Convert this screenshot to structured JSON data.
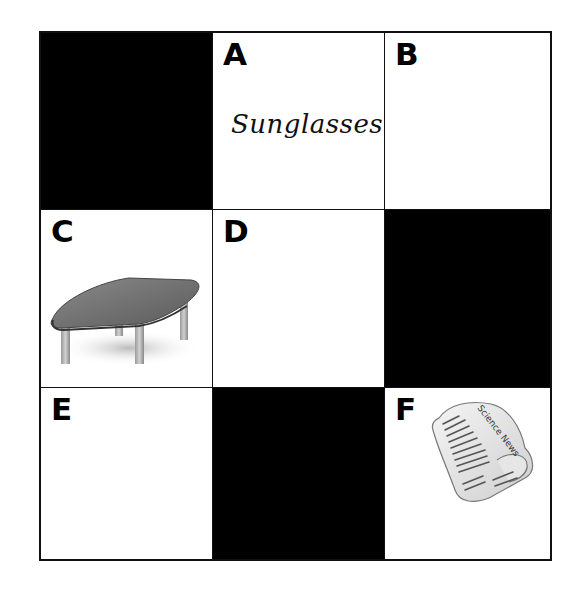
{
  "grid": {
    "rows": 3,
    "cols": 3,
    "cells": [
      {
        "position": "r1c1",
        "label": "",
        "fill": "#000000"
      },
      {
        "position": "r1c2",
        "label": "A",
        "content": "Sunglasses",
        "content_type": "handwritten-text"
      },
      {
        "position": "r1c3",
        "label": "B",
        "content": ""
      },
      {
        "position": "r2c1",
        "label": "C",
        "content": "table-icon",
        "content_type": "image"
      },
      {
        "position": "r2c2",
        "label": "D",
        "content": ""
      },
      {
        "position": "r2c3",
        "label": "",
        "fill": "#000000"
      },
      {
        "position": "r3c1",
        "label": "E",
        "content": ""
      },
      {
        "position": "r3c2",
        "label": "",
        "fill": "#000000"
      },
      {
        "position": "r3c3",
        "label": "F",
        "content": "newspaper-icon",
        "content_type": "image",
        "image_text": "Science News"
      }
    ]
  },
  "labels": {
    "a": "A",
    "b": "B",
    "c": "C",
    "d": "D",
    "e": "E",
    "f": "F"
  },
  "cell_a_text": "Sunglasses",
  "newspaper_title": "Science News",
  "colors": {
    "black_cell": "#000000",
    "border": "#111111",
    "background": "#ffffff"
  }
}
